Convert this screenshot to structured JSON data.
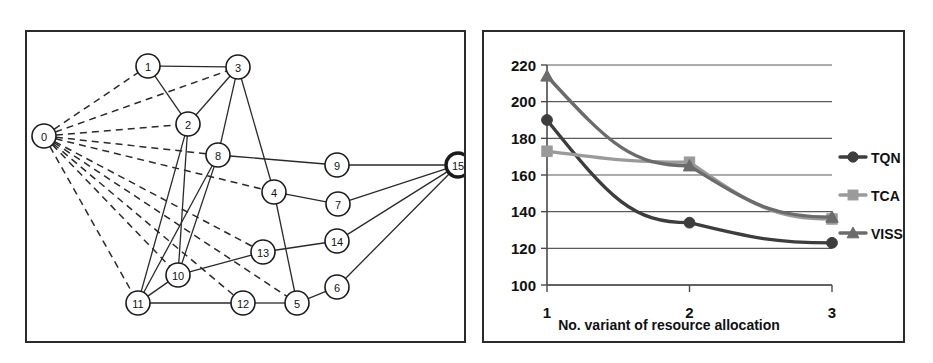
{
  "figure": {
    "panels": [
      {
        "name": "network-graph-panel"
      },
      {
        "name": "line-chart-panel"
      }
    ]
  },
  "graph": {
    "title": "",
    "nodes": [
      {
        "id": "0",
        "label": "0",
        "x": 44,
        "y": 136,
        "emphasis": false
      },
      {
        "id": "1",
        "label": "1",
        "x": 148,
        "y": 66,
        "emphasis": false
      },
      {
        "id": "2",
        "label": "2",
        "x": 188,
        "y": 124,
        "emphasis": false
      },
      {
        "id": "3",
        "label": "3",
        "x": 238,
        "y": 67,
        "emphasis": false
      },
      {
        "id": "4",
        "label": "4",
        "x": 274,
        "y": 192,
        "emphasis": false
      },
      {
        "id": "5",
        "label": "5",
        "x": 297,
        "y": 303,
        "emphasis": false
      },
      {
        "id": "6",
        "label": "6",
        "x": 337,
        "y": 287,
        "emphasis": false
      },
      {
        "id": "7",
        "label": "7",
        "x": 338,
        "y": 204,
        "emphasis": false
      },
      {
        "id": "8",
        "label": "8",
        "x": 218,
        "y": 155,
        "emphasis": false
      },
      {
        "id": "9",
        "label": "9",
        "x": 337,
        "y": 165,
        "emphasis": false
      },
      {
        "id": "10",
        "label": "10",
        "x": 178,
        "y": 275,
        "emphasis": false
      },
      {
        "id": "11",
        "label": "11",
        "x": 138,
        "y": 303,
        "emphasis": false
      },
      {
        "id": "12",
        "label": "12",
        "x": 243,
        "y": 303,
        "emphasis": false
      },
      {
        "id": "13",
        "label": "13",
        "x": 263,
        "y": 252,
        "emphasis": false
      },
      {
        "id": "14",
        "label": "14",
        "x": 337,
        "y": 241,
        "emphasis": false
      },
      {
        "id": "15",
        "label": "15",
        "x": 458,
        "y": 165,
        "emphasis": true
      }
    ],
    "edges_dashed": [
      [
        "0",
        "1"
      ],
      [
        "0",
        "3"
      ],
      [
        "0",
        "2"
      ],
      [
        "0",
        "8"
      ],
      [
        "0",
        "4"
      ],
      [
        "0",
        "13"
      ],
      [
        "0",
        "10"
      ],
      [
        "0",
        "11"
      ],
      [
        "0",
        "5"
      ],
      [
        "0",
        "12"
      ]
    ],
    "edges_solid": [
      [
        "1",
        "3"
      ],
      [
        "1",
        "2"
      ],
      [
        "2",
        "3"
      ],
      [
        "3",
        "8"
      ],
      [
        "3",
        "4"
      ],
      [
        "2",
        "10"
      ],
      [
        "8",
        "9"
      ],
      [
        "8",
        "10"
      ],
      [
        "4",
        "7"
      ],
      [
        "4",
        "5"
      ],
      [
        "9",
        "15"
      ],
      [
        "7",
        "15"
      ],
      [
        "14",
        "15"
      ],
      [
        "6",
        "15"
      ],
      [
        "13",
        "14"
      ],
      [
        "10",
        "13"
      ],
      [
        "10",
        "11"
      ],
      [
        "11",
        "12"
      ],
      [
        "12",
        "5"
      ],
      [
        "5",
        "6"
      ],
      [
        "11",
        "2"
      ],
      [
        "8",
        "11"
      ]
    ],
    "node_radius": 12
  },
  "chart_data": {
    "type": "line",
    "title": "",
    "xlabel": "No. variant of resource allocation",
    "ylabel": "",
    "x": [
      1,
      2,
      3
    ],
    "categories": [
      "1",
      "2",
      "3"
    ],
    "xtick_labels": [
      "1",
      "2",
      "3"
    ],
    "ytick_labels": [
      "100",
      "120",
      "140",
      "160",
      "180",
      "200",
      "220"
    ],
    "yticks": [
      100,
      120,
      140,
      160,
      180,
      200,
      220
    ],
    "ylim": [
      100,
      220
    ],
    "xlim": [
      1,
      3
    ],
    "grid": true,
    "grid_axis": "y",
    "legend_position": "right",
    "series": [
      {
        "name": "TQN",
        "values": [
          190,
          134,
          123
        ],
        "color": "#3d3d3d",
        "marker": "circle"
      },
      {
        "name": "TCA",
        "values": [
          173,
          167,
          136
        ],
        "color": "#9a9a9a",
        "marker": "square"
      },
      {
        "name": "VISSIM",
        "values": [
          214,
          165,
          137
        ],
        "color": "#6b6b6b",
        "marker": "triangle"
      }
    ]
  },
  "legend": {
    "entries": [
      {
        "label": "TQN"
      },
      {
        "label": "TCA"
      },
      {
        "label": "VISSIM"
      }
    ]
  }
}
